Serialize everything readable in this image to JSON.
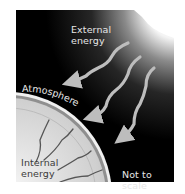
{
  "diagram": {
    "labels": {
      "external": [
        "External",
        "energy"
      ],
      "atmosphere": "Atmosphere",
      "internal": [
        "Internal",
        "energy"
      ],
      "scale_note": "Not to scale"
    },
    "colors": {
      "background": "#000000",
      "sun_glow": "#ffffff",
      "arrow": "#bdbdbd",
      "planet_outer": "#a9a9a9",
      "planet_inner": "#d9d9d9",
      "atmosphere_line": "#f0f0f0",
      "crack": "#555555"
    },
    "arrows": {
      "count": 3,
      "direction": "from sun toward planet"
    },
    "internal_cracks": {
      "count": 5
    }
  }
}
